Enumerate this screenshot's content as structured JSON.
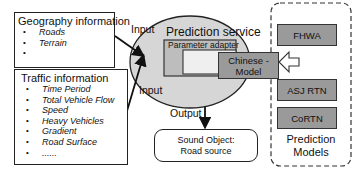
{
  "geography": {
    "title": "Geography information",
    "items": [
      "Roads",
      "Terrain",
      ""
    ]
  },
  "traffic": {
    "title": "Traffic information",
    "items": [
      "Time Period",
      "Total Vehicle Flow",
      "Speed",
      "Heavy Vehicles",
      "Gradient",
      "Road Surface",
      "......"
    ]
  },
  "arrows": {
    "input_top": "Input",
    "input_bottom": "Input",
    "output": "Output"
  },
  "prediction_service": {
    "title": "Prediction service",
    "parameter_adapter": "Parameter adapter",
    "chinese_model": "Chinese - Model"
  },
  "sound_object": {
    "line1": "Sound Object:",
    "line2": "Road source"
  },
  "prediction_models": {
    "models": [
      "FHWA",
      "ASJ RTN",
      "CoRTN"
    ],
    "label_line1": "Prediction",
    "label_line2": "Models"
  },
  "colors": {
    "model_box_fill": "#9a9a9a",
    "ellipse_fill": "#d6d6d6",
    "adapter_fill": "#bdbdbd",
    "inner_fill": "#efefef"
  }
}
